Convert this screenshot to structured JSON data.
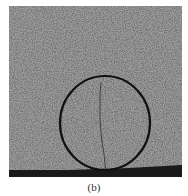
{
  "figure": {
    "caption": "(b)",
    "colors": {
      "surface": "#9c9c9c",
      "speckle_dark": "#5a5a5a",
      "circle": "#111111",
      "crack": "#3a3a3a",
      "base_band": "#1a1a1a"
    },
    "annotation": {
      "shape": "circle",
      "label": "crack region"
    }
  }
}
